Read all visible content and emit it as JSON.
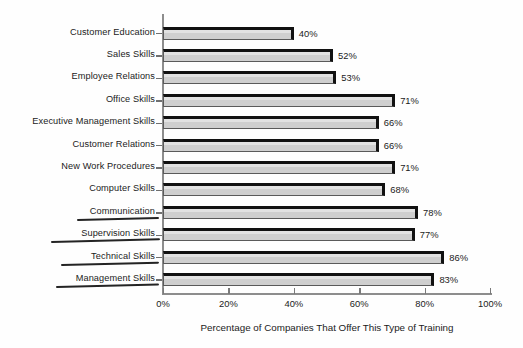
{
  "chart_data": {
    "type": "bar",
    "orientation": "horizontal",
    "title": "",
    "xlabel": "Percentage of Companies That Offer This Type of Training",
    "ylabel": "",
    "xlim": [
      0,
      100
    ],
    "xticks": [
      0,
      20,
      40,
      60,
      80,
      100
    ],
    "xtick_labels": [
      "0%",
      "20%",
      "40%",
      "60%",
      "80%",
      "100%"
    ],
    "grid": false,
    "legend": null,
    "value_suffix": "%",
    "categories": [
      "Customer Education",
      "Sales Skills",
      "Employee Relations",
      "Office Skills",
      "Executive Management Skills",
      "Customer Relations",
      "New Work Procedures",
      "Computer Skills",
      "Communication",
      "Supervision Skills",
      "Technical Skills",
      "Management Skills"
    ],
    "values": [
      40,
      52,
      53,
      71,
      66,
      66,
      71,
      68,
      78,
      77,
      86,
      83
    ],
    "value_labels": [
      "40%",
      "52%",
      "53%",
      "71%",
      "66%",
      "66%",
      "71%",
      "68%",
      "78%",
      "77%",
      "86%",
      "83%"
    ],
    "underlined_categories": [
      "Communication",
      "Supervision Skills",
      "Technical Skills",
      "Management Skills"
    ],
    "colors": {
      "bar_fill": "#cfcfcf",
      "bar_edge": "#111111",
      "axis": "#8d8d8d",
      "text": "#1b1b1b",
      "background": "#fefefe",
      "underline": "#242424"
    }
  }
}
